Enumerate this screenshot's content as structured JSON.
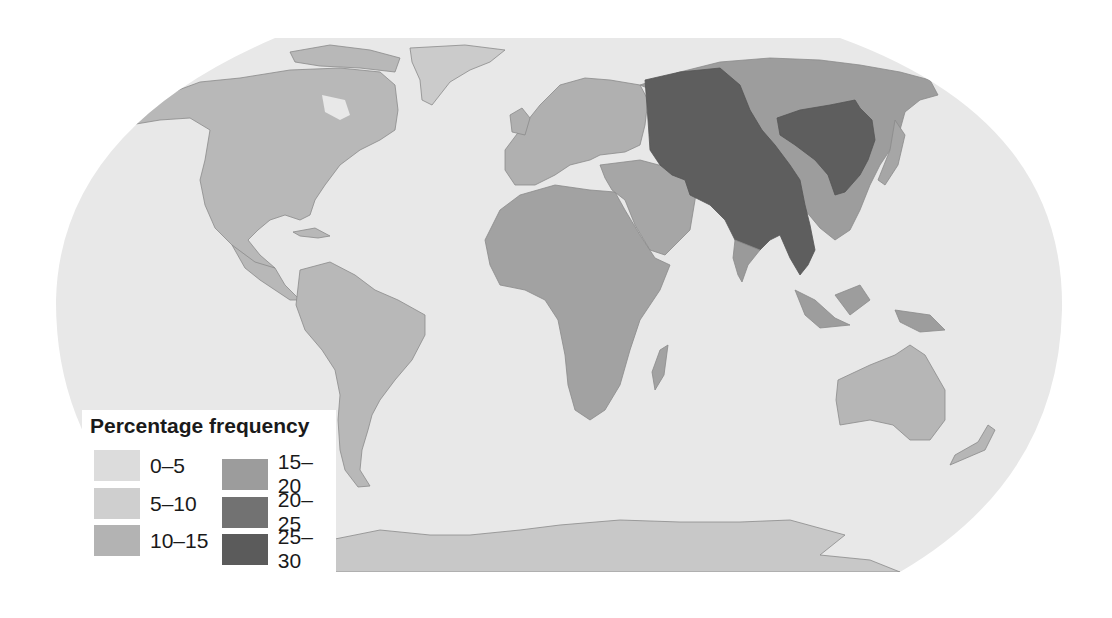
{
  "map": {
    "title": "Percentage frequency",
    "type": "world choropleth (Robinson-style projection)",
    "ocean_color": "#e6e6e6",
    "regions": [
      {
        "name": "North America",
        "class": "10-15"
      },
      {
        "name": "Greenland",
        "class": "5-10"
      },
      {
        "name": "South America",
        "class": "10-15"
      },
      {
        "name": "Europe",
        "class": "10-15"
      },
      {
        "name": "Africa",
        "class": "15-20"
      },
      {
        "name": "Middle East / Arabia",
        "class": "15-20"
      },
      {
        "name": "Western Siberia / Central Asia",
        "class": "25-30"
      },
      {
        "name": "Northern China / Mongolia",
        "class": "25-30"
      },
      {
        "name": "South & Southeast Asia (mainland)",
        "class": "25-30"
      },
      {
        "name": "Eastern Siberia",
        "class": "15-20"
      },
      {
        "name": "India (south)",
        "class": "15-20"
      },
      {
        "name": "Japan / Maritime SE Asia",
        "class": "15-20"
      },
      {
        "name": "Australia",
        "class": "10-15"
      },
      {
        "name": "Antarctica",
        "class": "5-10"
      }
    ]
  },
  "legend": {
    "title": "Percentage frequency",
    "items": [
      {
        "label": "0–5",
        "color": "#dcdcdc"
      },
      {
        "label": "5–10",
        "color": "#cfcfcf"
      },
      {
        "label": "10–15",
        "color": "#b3b3b3"
      },
      {
        "label": "15–20",
        "color": "#9c9c9c"
      },
      {
        "label": "20–25",
        "color": "#727272"
      },
      {
        "label": "25–30",
        "color": "#5b5b5b"
      }
    ]
  }
}
